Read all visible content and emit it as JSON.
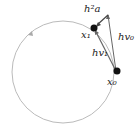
{
  "diagram": {
    "labels": {
      "accel": "h²a",
      "x1": "x₁",
      "x0": "x₀",
      "v1": "hv₁",
      "v0": "hv₀"
    },
    "colors": {
      "orbit": "#bbbbbb",
      "vector": "#555555",
      "point": "#111111"
    }
  }
}
